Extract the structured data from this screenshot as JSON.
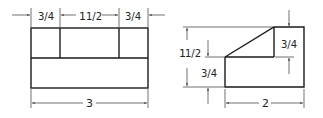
{
  "figure": {
    "type": "orthographic-views",
    "views": [
      {
        "name": "front-view",
        "dimensions": {
          "top_left": "3/4",
          "top_middle": "1 1/2",
          "top_right": "3/4",
          "overall_width": "3"
        }
      },
      {
        "name": "side-view",
        "dimensions": {
          "overall_height": "1 1/2",
          "lower_height": "3/4",
          "upper_height": "3/4",
          "overall_width": "2"
        }
      }
    ]
  },
  "labels": {
    "front_left": "3/4",
    "front_mid_whole": "1",
    "front_mid_frac": "1/2",
    "front_right": "3/4",
    "front_width": "3",
    "side_height_whole": "1",
    "side_height_frac": "1/2",
    "side_lower": "3/4",
    "side_upper": "3/4",
    "side_width": "2"
  }
}
